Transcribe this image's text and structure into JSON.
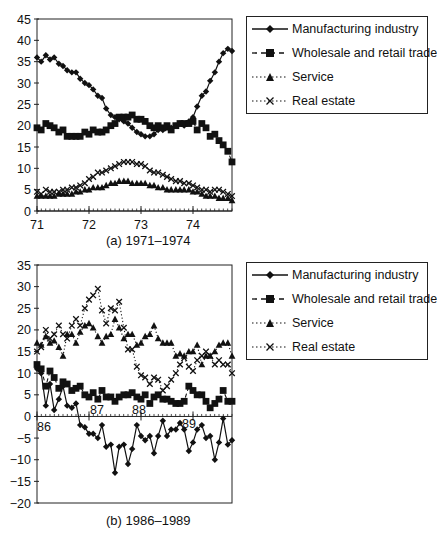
{
  "chart_data": [
    {
      "type": "line",
      "title": "",
      "caption": "(a)  1971–1974",
      "xlabel": "",
      "ylabel": "",
      "ylim": [
        0,
        45
      ],
      "yticks": [
        0,
        5,
        10,
        15,
        20,
        25,
        30,
        35,
        40,
        45
      ],
      "xtick_labels": [
        "71",
        "72",
        "73",
        "74"
      ],
      "x_range": [
        71,
        74.75
      ],
      "grid": false,
      "legend_position": "right",
      "series": [
        {
          "name": "Manufacturing industry",
          "marker": "diamond",
          "line": "solid",
          "x": [
            71.0,
            71.08,
            71.17,
            71.25,
            71.33,
            71.42,
            71.5,
            71.58,
            71.67,
            71.75,
            71.83,
            71.92,
            72.0,
            72.08,
            72.17,
            72.25,
            72.33,
            72.42,
            72.5,
            72.58,
            72.67,
            72.75,
            72.83,
            72.92,
            73.0,
            73.08,
            73.17,
            73.25,
            73.33,
            73.42,
            73.5,
            73.58,
            73.67,
            73.75,
            73.83,
            73.92,
            74.0,
            74.08,
            74.17,
            74.25,
            74.33,
            74.42,
            74.5,
            74.58,
            74.67,
            74.75
          ],
          "values": [
            36,
            35,
            36.5,
            35.5,
            36,
            34.5,
            34,
            33,
            32.5,
            32.5,
            31,
            30,
            29.5,
            28.5,
            27,
            26.5,
            24,
            22.5,
            22,
            21.5,
            21,
            20.5,
            19.5,
            18.5,
            18,
            17.5,
            17.5,
            18,
            19,
            19,
            19.5,
            19.5,
            20,
            20.5,
            20,
            21,
            22,
            24.5,
            27,
            28,
            30.5,
            32.5,
            35,
            37,
            38,
            37.5
          ]
        },
        {
          "name": "Wholesale and retail trade",
          "marker": "square",
          "line": "dashed",
          "x": [
            71.0,
            71.08,
            71.17,
            71.25,
            71.33,
            71.42,
            71.5,
            71.58,
            71.67,
            71.75,
            71.83,
            71.92,
            72.0,
            72.08,
            72.17,
            72.25,
            72.33,
            72.42,
            72.5,
            72.58,
            72.67,
            72.75,
            72.83,
            72.92,
            73.0,
            73.08,
            73.17,
            73.25,
            73.33,
            73.42,
            73.5,
            73.58,
            73.67,
            73.75,
            73.83,
            73.92,
            74.0,
            74.08,
            74.17,
            74.25,
            74.33,
            74.42,
            74.5,
            74.58,
            74.67,
            74.75
          ],
          "values": [
            19.5,
            19,
            20.5,
            20,
            19.5,
            18.5,
            19,
            17.5,
            17.5,
            17.5,
            17.5,
            18.5,
            18,
            19,
            18.5,
            18.5,
            19,
            20,
            20.5,
            22,
            22,
            22,
            22.5,
            21.5,
            21.5,
            21,
            20,
            19.5,
            20,
            19.5,
            20,
            19,
            20,
            20.5,
            20.5,
            20.5,
            21,
            19,
            20.5,
            19.5,
            17.5,
            18,
            16.5,
            15.5,
            14,
            11.5
          ]
        },
        {
          "name": "Service",
          "marker": "triangle",
          "line": "dotted",
          "x": [
            71.0,
            71.08,
            71.17,
            71.25,
            71.33,
            71.42,
            71.5,
            71.58,
            71.67,
            71.75,
            71.83,
            71.92,
            72.0,
            72.08,
            72.17,
            72.25,
            72.33,
            72.42,
            72.5,
            72.58,
            72.67,
            72.75,
            72.83,
            72.92,
            73.0,
            73.08,
            73.17,
            73.25,
            73.33,
            73.42,
            73.5,
            73.58,
            73.67,
            73.75,
            73.83,
            73.92,
            74.0,
            74.08,
            74.17,
            74.25,
            74.33,
            74.42,
            74.5,
            74.58,
            74.67,
            74.75
          ],
          "values": [
            3.5,
            3.5,
            3.5,
            3.5,
            3.5,
            4,
            4,
            4,
            4,
            4.5,
            4.5,
            5,
            5,
            5.5,
            5.5,
            5.5,
            6,
            6.5,
            6.5,
            7,
            7,
            7,
            6.5,
            6.5,
            6.5,
            6.5,
            6,
            6,
            5.5,
            5.5,
            5,
            5,
            5,
            5,
            5,
            5,
            4.5,
            4.5,
            4,
            3.5,
            3.5,
            3.5,
            3,
            3,
            3,
            2.5
          ]
        },
        {
          "name": "Real estate",
          "marker": "x",
          "line": "dotted",
          "x": [
            71.0,
            71.08,
            71.17,
            71.25,
            71.33,
            71.42,
            71.5,
            71.58,
            71.67,
            71.75,
            71.83,
            71.92,
            72.0,
            72.08,
            72.17,
            72.25,
            72.33,
            72.42,
            72.5,
            72.58,
            72.67,
            72.75,
            72.83,
            72.92,
            73.0,
            73.08,
            73.17,
            73.25,
            73.33,
            73.42,
            73.5,
            73.58,
            73.67,
            73.75,
            73.83,
            73.92,
            74.0,
            74.08,
            74.17,
            74.25,
            74.33,
            74.42,
            74.5,
            74.58,
            74.67,
            74.75
          ],
          "values": [
            4.5,
            4,
            5,
            4.5,
            4.5,
            4.5,
            5,
            5,
            5.5,
            5.5,
            6,
            6.5,
            7.5,
            8,
            9,
            9,
            9.5,
            10,
            10.5,
            11,
            11.5,
            11.5,
            11.5,
            11,
            11,
            10.5,
            9.5,
            9,
            9,
            8.5,
            8,
            7.5,
            7,
            7,
            6.5,
            6.5,
            6,
            5.5,
            5,
            5,
            4.5,
            5,
            5,
            4.5,
            4,
            3.5
          ]
        }
      ]
    },
    {
      "type": "line",
      "title": "",
      "caption": "(b)  1986–1989",
      "xlabel": "",
      "ylabel": "",
      "ylim": [
        -20,
        35
      ],
      "yticks": [
        -20,
        -15,
        -10,
        -5,
        0,
        5,
        10,
        15,
        20,
        25,
        30,
        35
      ],
      "xtick_labels": [
        "86",
        "87",
        "88",
        "89"
      ],
      "x_range": [
        86,
        89.75
      ],
      "grid": false,
      "legend_position": "right",
      "series": [
        {
          "name": "Manufacturing industry",
          "marker": "diamond",
          "line": "solid",
          "x": [
            86.0,
            86.08,
            86.17,
            86.25,
            86.33,
            86.42,
            86.5,
            86.58,
            86.67,
            86.75,
            86.83,
            86.92,
            87.0,
            87.08,
            87.17,
            87.25,
            87.33,
            87.42,
            87.5,
            87.58,
            87.67,
            87.75,
            87.83,
            87.92,
            88.0,
            88.08,
            88.17,
            88.25,
            88.33,
            88.42,
            88.5,
            88.58,
            88.67,
            88.75,
            88.83,
            88.92,
            89.0,
            89.08,
            89.17,
            89.25,
            89.33,
            89.42,
            89.5,
            89.58,
            89.67,
            89.75
          ],
          "values": [
            11,
            10,
            2.5,
            7.5,
            1.5,
            4,
            7,
            2.5,
            2,
            3,
            -2,
            -2.5,
            -4,
            -4,
            -5,
            -2,
            -7,
            -6.5,
            -13,
            -7,
            -6.5,
            -11,
            -7.5,
            -2,
            -4.5,
            -5.5,
            -4.5,
            -8.5,
            -4.5,
            -1,
            -4.5,
            -3,
            -3,
            -1.5,
            -3,
            -8,
            -6,
            -3,
            -2,
            -5,
            -4.5,
            -10,
            -6,
            -0.5,
            -6.5,
            -5.5
          ]
        },
        {
          "name": "Wholesale and retail trade",
          "marker": "square",
          "line": "dashed",
          "x": [
            86.0,
            86.08,
            86.17,
            86.25,
            86.33,
            86.42,
            86.5,
            86.58,
            86.67,
            86.75,
            86.83,
            86.92,
            87.0,
            87.08,
            87.17,
            87.25,
            87.33,
            87.42,
            87.5,
            87.58,
            87.67,
            87.75,
            87.83,
            87.92,
            88.0,
            88.08,
            88.17,
            88.25,
            88.33,
            88.42,
            88.5,
            88.58,
            88.67,
            88.75,
            88.83,
            88.92,
            89.0,
            89.08,
            89.17,
            89.25,
            89.33,
            89.42,
            89.5,
            89.58,
            89.67,
            89.75
          ],
          "values": [
            12,
            11,
            7,
            10.5,
            9,
            6.5,
            8,
            7.5,
            6,
            6.5,
            7,
            5,
            4.5,
            5.5,
            4,
            6,
            4.5,
            4.5,
            3.5,
            4.5,
            5,
            5,
            5.5,
            4.5,
            4,
            5,
            3,
            4.5,
            5,
            4,
            4,
            3.5,
            3,
            3,
            3.5,
            7,
            6,
            5,
            5,
            3.5,
            2,
            3,
            4,
            6,
            3.5,
            3.5
          ]
        },
        {
          "name": "Service",
          "marker": "triangle",
          "line": "dotted",
          "x": [
            86.0,
            86.08,
            86.17,
            86.25,
            86.33,
            86.42,
            86.5,
            86.58,
            86.67,
            86.75,
            86.83,
            86.92,
            87.0,
            87.08,
            87.17,
            87.25,
            87.33,
            87.42,
            87.5,
            87.58,
            87.67,
            87.75,
            87.83,
            87.92,
            88.0,
            88.08,
            88.17,
            88.25,
            88.33,
            88.42,
            88.5,
            88.58,
            88.67,
            88.75,
            88.83,
            88.92,
            89.0,
            89.08,
            89.17,
            89.25,
            89.33,
            89.42,
            89.5,
            89.58,
            89.67,
            89.75
          ],
          "values": [
            17,
            16.5,
            18.5,
            17,
            17.5,
            16,
            14,
            19,
            19,
            17,
            19.5,
            21,
            21.5,
            20.5,
            18.5,
            17,
            18.5,
            19,
            22.5,
            20.5,
            18,
            19,
            19,
            16.5,
            17,
            18.5,
            19,
            21,
            18,
            17,
            17,
            17,
            14,
            14.5,
            14,
            15,
            15,
            16.5,
            12,
            14,
            14,
            15,
            16.5,
            17,
            17,
            14
          ]
        },
        {
          "name": "Real estate",
          "marker": "x",
          "line": "dotted",
          "x": [
            86.0,
            86.08,
            86.17,
            86.25,
            86.33,
            86.42,
            86.5,
            86.58,
            86.67,
            86.75,
            86.83,
            86.92,
            87.0,
            87.08,
            87.17,
            87.25,
            87.33,
            87.42,
            87.5,
            87.58,
            87.67,
            87.75,
            87.83,
            87.92,
            88.0,
            88.08,
            88.17,
            88.25,
            88.33,
            88.42,
            88.5,
            88.58,
            88.67,
            88.75,
            88.83,
            88.92,
            89.0,
            89.08,
            89.17,
            89.25,
            89.33,
            89.42,
            89.5,
            89.58,
            89.67,
            89.75
          ],
          "values": [
            15,
            16,
            20,
            18,
            19,
            21,
            19,
            18,
            21,
            22.5,
            21,
            25,
            27,
            28,
            29.5,
            24.5,
            21.5,
            25,
            24.5,
            26.5,
            20.5,
            15.5,
            15.5,
            11.5,
            9.5,
            9,
            7.5,
            9,
            8.5,
            6,
            7,
            8.5,
            10,
            12,
            13.5,
            11.5,
            10.5,
            13,
            14,
            15,
            14,
            12,
            13,
            12,
            12,
            10
          ]
        }
      ]
    }
  ],
  "legend": {
    "items": [
      {
        "label": "Manufacturing industry"
      },
      {
        "label": "Wholesale and retail trade"
      },
      {
        "label": "Service"
      },
      {
        "label": "Real estate"
      }
    ]
  },
  "captions": {
    "a": "(a)  1971–1974",
    "b": "(b)  1986–1989"
  }
}
